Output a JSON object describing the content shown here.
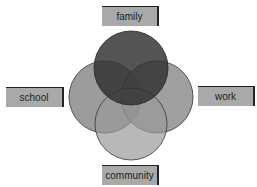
{
  "diagram": {
    "type": "venn",
    "sets": [
      {
        "id": "family",
        "label": "family",
        "position": "top"
      },
      {
        "id": "school",
        "label": "school",
        "position": "left"
      },
      {
        "id": "work",
        "label": "work",
        "position": "right"
      },
      {
        "id": "community",
        "label": "community",
        "position": "bottom"
      }
    ],
    "colors": {
      "label_fill": "#a9a9a9",
      "family_fill": "#3a3a3a",
      "side_fill": "#9a9a9a",
      "community_fill": "#a8a8a8",
      "outline": "#333333"
    }
  }
}
